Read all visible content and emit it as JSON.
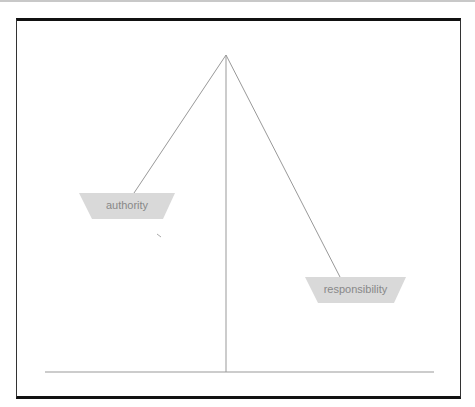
{
  "diagram": {
    "type": "balance-scale",
    "left_pan": {
      "label": "authority"
    },
    "right_pan": {
      "label": "responsibility"
    },
    "colors": {
      "pan_fill": "#d9d9d9",
      "line": "#999999",
      "label": "#888888",
      "frame": "#111111"
    }
  }
}
